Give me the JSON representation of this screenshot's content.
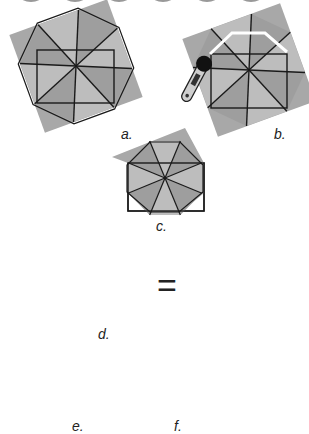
{
  "diagram": {
    "colors": {
      "light": "#bdbdbd",
      "dark": "#9a9a9a",
      "darker": "#7c7c7c",
      "line": "#1a1a1a",
      "cut": "#ffffff"
    },
    "steps": [
      {
        "id": "a",
        "label": "a."
      },
      {
        "id": "b",
        "label": "b."
      },
      {
        "id": "c",
        "label": "c."
      },
      {
        "id": "d",
        "label": "d."
      },
      {
        "id": "e",
        "label": "e."
      },
      {
        "id": "f",
        "label": "f."
      }
    ],
    "equals": "="
  }
}
